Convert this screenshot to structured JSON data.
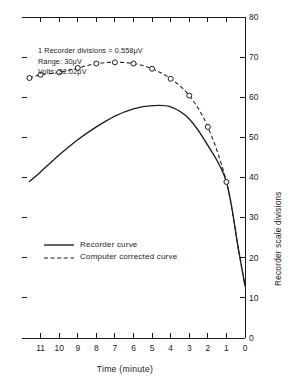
{
  "chart_data": {
    "type": "line",
    "title": "",
    "xlabel": "Time (minute)",
    "ylabel": "Recorder scale divisions",
    "xlim": [
      12,
      0
    ],
    "ylim": [
      0,
      80
    ],
    "x_axis_reversed": true,
    "grid": false,
    "legend_position": "inside-lower-left",
    "xticks": [
      "11",
      "10",
      "9",
      "8",
      "7",
      "6",
      "5",
      "4",
      "3",
      "2",
      "1",
      "0"
    ],
    "xtick_values": [
      11,
      10,
      9,
      8,
      7,
      6,
      5,
      4,
      3,
      2,
      1,
      0
    ],
    "yticks": [
      "0",
      "10",
      "20",
      "30",
      "40",
      "50",
      "60",
      "70",
      "80"
    ],
    "ytick_values": [
      0,
      10,
      20,
      30,
      40,
      50,
      60,
      70,
      80
    ],
    "x": [
      11.6,
      11,
      10,
      9,
      8,
      7,
      6,
      5,
      4,
      3,
      2,
      1,
      0.35,
      0
    ],
    "series": [
      {
        "name": "Recorder curve",
        "style": "solid",
        "markers": false,
        "values": [
          39.0,
          41.4,
          45.6,
          49.4,
          52.6,
          55.3,
          57.1,
          57.9,
          57.6,
          54.6,
          48.0,
          38.9,
          22.0,
          13.0
        ]
      },
      {
        "name": "Computer corrected curve",
        "style": "dashed",
        "markers": true,
        "marker_shape": "open-circle",
        "x_markers": [
          11.6,
          11,
          10,
          9,
          8,
          7,
          6,
          5,
          4,
          3,
          2,
          1
        ],
        "values": [
          64.8,
          65.6,
          66.2,
          67.3,
          68.4,
          68.7,
          68.4,
          67.1,
          64.6,
          60.4,
          52.6,
          38.9,
          22.0,
          13.0
        ]
      }
    ],
    "annotations": [
      "1 Recorder divisions = 0.558μV",
      "Range: 30μV",
      "Volts: 32.02μV"
    ]
  },
  "legend": {
    "items": [
      {
        "label": "Recorder curve",
        "style": "solid"
      },
      {
        "label": "Computer corrected curve",
        "style": "dashed"
      }
    ]
  },
  "axes": {
    "x_title": "Time (minute)",
    "y_title": "Recorder scale divisions"
  },
  "colors": {
    "ink": "#1c1c1c",
    "background": "#ffffff"
  }
}
